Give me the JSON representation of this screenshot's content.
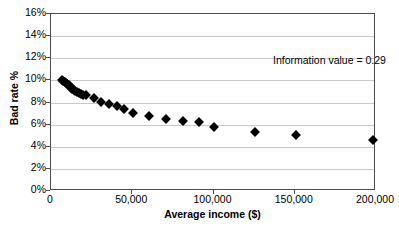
{
  "chart_data": {
    "type": "scatter",
    "title": "",
    "xlabel": "Average income ($)",
    "ylabel": "Bad rate %",
    "xlim": [
      0,
      200000
    ],
    "ylim": [
      0,
      16
    ],
    "grid": "horizontal",
    "legend": "none",
    "marker": "diamond",
    "marker_color": "#000000",
    "xtick_labels": [
      "0",
      "50,000",
      "100,000",
      "150,000",
      "200,000"
    ],
    "xtick_values": [
      0,
      50000,
      100000,
      150000,
      200000
    ],
    "ytick_labels": [
      "0%",
      "2%",
      "4%",
      "6%",
      "8%",
      "10%",
      "12%",
      "14%",
      "16%"
    ],
    "ytick_values": [
      0,
      2,
      4,
      6,
      8,
      10,
      12,
      14,
      16
    ],
    "annotations": [
      {
        "text": "Information value = 0.29",
        "x": 128000,
        "y": 13.6
      }
    ],
    "points": [
      {
        "x": 6800,
        "y": 10.05
      },
      {
        "x": 7600,
        "y": 9.95
      },
      {
        "x": 8400,
        "y": 9.85
      },
      {
        "x": 9200,
        "y": 9.75
      },
      {
        "x": 10000,
        "y": 9.65
      },
      {
        "x": 10800,
        "y": 9.55
      },
      {
        "x": 11600,
        "y": 9.45
      },
      {
        "x": 12400,
        "y": 9.35
      },
      {
        "x": 13200,
        "y": 9.25
      },
      {
        "x": 14000,
        "y": 9.15
      },
      {
        "x": 15000,
        "y": 9.05
      },
      {
        "x": 16000,
        "y": 8.95
      },
      {
        "x": 17200,
        "y": 8.85
      },
      {
        "x": 18400,
        "y": 8.78
      },
      {
        "x": 19800,
        "y": 8.72
      },
      {
        "x": 21500,
        "y": 8.68
      },
      {
        "x": 26500,
        "y": 8.45
      },
      {
        "x": 31000,
        "y": 8.05
      },
      {
        "x": 35500,
        "y": 7.88
      },
      {
        "x": 40500,
        "y": 7.7
      },
      {
        "x": 45000,
        "y": 7.45
      },
      {
        "x": 50500,
        "y": 7.08
      },
      {
        "x": 60500,
        "y": 6.8
      },
      {
        "x": 71000,
        "y": 6.48
      },
      {
        "x": 81000,
        "y": 6.35
      },
      {
        "x": 91000,
        "y": 6.22
      },
      {
        "x": 100500,
        "y": 5.8
      },
      {
        "x": 125500,
        "y": 5.32
      },
      {
        "x": 150500,
        "y": 5.08
      },
      {
        "x": 198000,
        "y": 4.65
      }
    ]
  }
}
